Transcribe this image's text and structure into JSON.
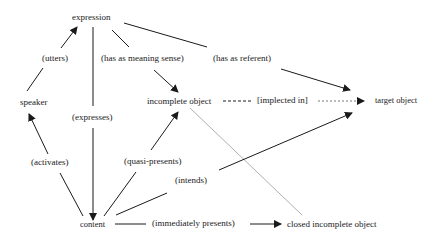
{
  "diagram": {
    "nodes": {
      "expression": "expression",
      "speaker": "speaker",
      "incomplete_object": "incomplete object",
      "target_object": "target object",
      "content": "content",
      "closed_incomplete_object": "closed incomplete object"
    },
    "edges": {
      "utters": "(utters)",
      "has_as_meaning_sense": "(has as meaning sense)",
      "has_as_referent": "(has as referent)",
      "expresses": "(expresses)",
      "implected_in": "[implected in]",
      "activates": "(activates)",
      "quasi_presents": "(quasi-presents)",
      "intends": "(intends)",
      "immediately_presents": "(immediately presents)"
    },
    "colors": {
      "line": "#1a1a1a",
      "faint_line": "#b0b0b0",
      "background": "#ffffff"
    }
  }
}
